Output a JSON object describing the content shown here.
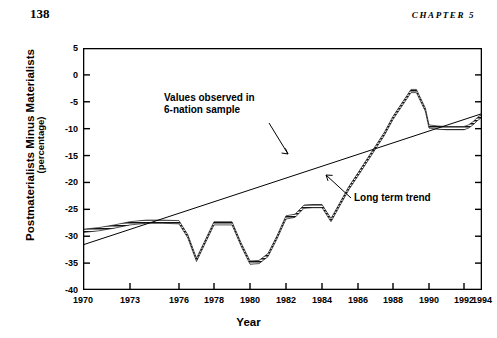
{
  "header": {
    "page_number": "138",
    "chapter_label": "CHAPTER 5"
  },
  "chart_data": {
    "type": "line",
    "title": "",
    "xlabel": "Year",
    "ylabel": "Postmaterialists Minus Materialists",
    "ylabel_sub": "(percentage)",
    "xlim": [
      1970,
      1994
    ],
    "ylim": [
      -40,
      5
    ],
    "grid": false,
    "legend": "none",
    "y_ticks": [
      "5",
      "0",
      "-5",
      "-10",
      "-15",
      "-20",
      "-25",
      "-30",
      "-35",
      "-40"
    ],
    "y_tick_values": [
      5,
      0,
      -5,
      -10,
      -15,
      -20,
      -25,
      -30,
      -35,
      -40
    ],
    "x_ticks": [
      "1970",
      "1973",
      "1976",
      "1978",
      "1980",
      "1982",
      "1984",
      "1986",
      "1988",
      "1990",
      "1992",
      "1994"
    ],
    "x_tick_values": [
      1970,
      1973,
      1976,
      1978,
      1980,
      1982,
      1984,
      1986,
      1988,
      1990,
      1992,
      1994
    ],
    "annotations": [
      {
        "name": "observed-series-annotation",
        "text": "Values observed in\n6-nation sample"
      },
      {
        "name": "trend-line-annotation",
        "text": "Long term trend"
      }
    ],
    "series": [
      {
        "name": "Values observed in 6-nation sample",
        "style": "hatched-band",
        "x": [
          1970,
          1971,
          1972,
          1973,
          1974,
          1975,
          1976,
          1976.5,
          1977,
          1977.5,
          1978,
          1978.5,
          1979,
          1979.5,
          1980,
          1980.5,
          1981,
          1981.5,
          1982,
          1982.5,
          1983,
          1983.5,
          1984,
          1984.5,
          1985,
          1985.5,
          1986,
          1986.5,
          1987,
          1987.5,
          1988,
          1988.5,
          1989,
          1989.3,
          1989.8,
          1990,
          1990.5,
          1991,
          1991.5,
          1992,
          1992.5,
          1993,
          1993.5,
          1994
        ],
        "values": [
          -29.0,
          -28.7,
          -28.2,
          -27.6,
          -27.3,
          -27.3,
          -27.4,
          -30.0,
          -34.4,
          -31.0,
          -27.6,
          -27.6,
          -27.6,
          -31.5,
          -34.9,
          -34.8,
          -33.5,
          -30.2,
          -26.5,
          -26.2,
          -24.5,
          -24.4,
          -24.4,
          -27.0,
          -24.0,
          -21.0,
          -18.5,
          -16.0,
          -13.5,
          -11.0,
          -8.0,
          -5.5,
          -3.0,
          -3.0,
          -6.5,
          -9.6,
          -9.8,
          -9.9,
          -9.9,
          -9.9,
          -9.6,
          -9.0,
          -8.2,
          -7.6
        ]
      },
      {
        "name": "Long term trend",
        "style": "thin-line",
        "x": [
          1970,
          1994
        ],
        "values": [
          -31.6,
          -7.2
        ]
      }
    ]
  }
}
